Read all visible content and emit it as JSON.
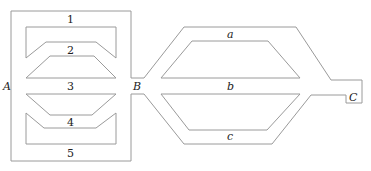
{
  "diagram": {
    "colors": {
      "wall": "#9a9a9a",
      "text": "#222222",
      "background": "#ffffff"
    },
    "nodes": [
      {
        "id": "A",
        "label": "A"
      },
      {
        "id": "B",
        "label": "B"
      },
      {
        "id": "C",
        "label": "C"
      }
    ],
    "left_channels": [
      {
        "label": "1"
      },
      {
        "label": "2"
      },
      {
        "label": "3"
      },
      {
        "label": "4"
      },
      {
        "label": "5"
      }
    ],
    "right_channels": [
      {
        "label": "a"
      },
      {
        "label": "b"
      },
      {
        "label": "c"
      }
    ]
  }
}
